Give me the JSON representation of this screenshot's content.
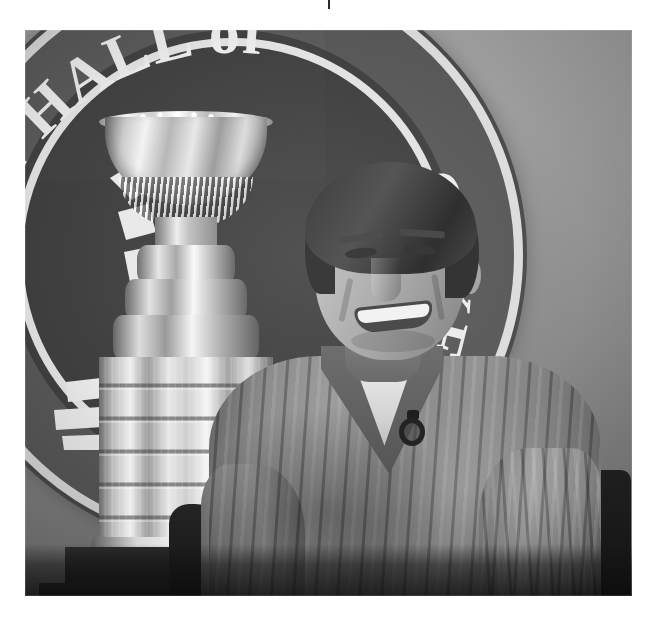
{
  "page": {
    "background_color": "#ffffff",
    "width": 657,
    "height": 626,
    "media_type": "photograph",
    "color_mode": "black-and-white"
  },
  "crop_tick": {
    "label": "",
    "color": "#2b2b2b"
  },
  "photo": {
    "caption": "",
    "alt": "Smiling man in a cable-knit V-neck sweater seated beside the Stanley Cup trophy in front of a large Hockey Hall of Fame logo backdrop",
    "left": 25,
    "top": 30,
    "width": 607,
    "height": 566,
    "palette": {
      "backdrop_light": "#a2a2a2",
      "backdrop_dark": "#7c7c7c",
      "roundel_fill": "#4a4a4a",
      "roundel_ring": "#dcdcdc",
      "logo_text": "#ececec",
      "trophy_highlight": "#f6f6f6",
      "trophy_shadow": "#5e5e5e",
      "sweater_mid": "#8c8c8c",
      "tshirt_white": "#f0f0f0",
      "hair_dark": "#3d3d3d",
      "base_black": "#131313"
    }
  },
  "backdrop_logo": {
    "name": "hockey-hall-of-fame-roundel",
    "arc_top_text": "KEY HALL of",
    "arc_upper_right_text": "FAME",
    "arc_right_text": "OCKEY",
    "full_wordmark": "HOCKEY HALL of FAME",
    "separator_glyph": "•",
    "emblem": "player-silhouette"
  },
  "subject": {
    "name": "seated-man",
    "expression": "smiling",
    "garments": [
      {
        "name": "cable-knit-sweater",
        "style": "V-neck",
        "tone": "light grey"
      },
      {
        "name": "t-shirt",
        "style": "crew",
        "tone": "white"
      }
    ],
    "accessory": {
      "name": "lapel-microphone",
      "shape": "ring",
      "tone": "black"
    },
    "seating": {
      "name": "chair",
      "tone": "black"
    }
  },
  "trophy": {
    "name": "stanley-cup",
    "parts": [
      "bowl",
      "rim",
      "fluted-collar",
      "tiered-bands",
      "engraved-barrel",
      "pedestal"
    ],
    "finish": "polished silver"
  }
}
